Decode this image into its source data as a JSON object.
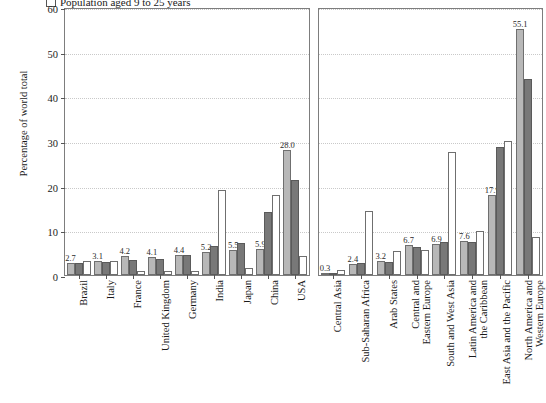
{
  "legend": {
    "items": [
      {
        "label": "Population aged 9 to 25 years",
        "marker": "empty-square-outline"
      }
    ]
  },
  "axes": {
    "ylabel": "Percentage of world total",
    "yticks": [
      "0",
      "10",
      "20",
      "30",
      "40",
      "50",
      "60"
    ]
  },
  "chart_data": {
    "type": "bar",
    "title": "",
    "xlabel": "",
    "ylabel": "Percentage of world total",
    "ylim": [
      0,
      60
    ],
    "yticks": [
      0,
      10,
      20,
      30,
      40,
      50,
      60
    ],
    "grid": true,
    "legend_position": "top-left",
    "orientation": "vertical",
    "grouping": "grouped",
    "panels": [
      {
        "name": "countries",
        "categories": [
          "Brazil",
          "Italy",
          "France",
          "United Kingdom",
          "Germany",
          "India",
          "Japan",
          "China",
          "USA"
        ],
        "series": [
          {
            "name": "series-1",
            "color": "#b8b8b8",
            "values": [
              2.7,
              3.1,
              4.2,
              4.1,
              4.4,
              5.2,
              5.5,
              5.9,
              28.0
            ],
            "labels": [
              "2.7",
              "3.1",
              "4.2",
              "4.1",
              "4.4",
              "5.2",
              "5.5",
              "5.9",
              "28.0"
            ]
          },
          {
            "name": "series-2",
            "color": "#787878",
            "values": [
              2.6,
              3.0,
              3.4,
              3.6,
              4.5,
              6.4,
              7.1,
              14.0,
              21.3
            ]
          },
          {
            "name": "series-3",
            "color": "#ffffff",
            "values": [
              3.1,
              3.2,
              0.9,
              1.0,
              0.9,
              19.0,
              1.5,
              18.0,
              4.2
            ]
          }
        ]
      },
      {
        "name": "regions",
        "categories": [
          "Central Asia",
          "Sub-Saharan Africa",
          "Arab States",
          "Central and Eastern Europe",
          "South and West Asia",
          "Latin America and the Caribbean",
          "East Asia and the Pacific",
          "North America and Western Europe"
        ],
        "categories_wrapped": [
          [
            "Central Asia",
            ""
          ],
          [
            "Sub-Saharan Africa",
            ""
          ],
          [
            "Arab States",
            ""
          ],
          [
            "Central and",
            "Eastern Europe"
          ],
          [
            "South and West Asia",
            ""
          ],
          [
            "Latin America and",
            "the Caribbean"
          ],
          [
            "East Asia and the Pacific",
            ""
          ],
          [
            "North America and",
            "Western Europe"
          ]
        ],
        "series": [
          {
            "name": "series-1",
            "color": "#b8b8b8",
            "values": [
              0.3,
              2.4,
              3.2,
              6.7,
              6.9,
              7.6,
              17.9,
              55.1
            ],
            "labels": [
              "0.3",
              "2.4",
              "3.2",
              "6.7",
              "6.9",
              "7.6",
              "17.9",
              "55.1"
            ]
          },
          {
            "name": "series-2",
            "color": "#787878",
            "values": [
              0.5,
              2.6,
              2.9,
              6.3,
              7.4,
              7.4,
              28.7,
              43.9
            ]
          },
          {
            "name": "series-3",
            "color": "#ffffff",
            "values": [
              1.1,
              14.4,
              5.3,
              5.5,
              27.6,
              9.9,
              30.0,
              8.6
            ]
          }
        ]
      }
    ]
  }
}
